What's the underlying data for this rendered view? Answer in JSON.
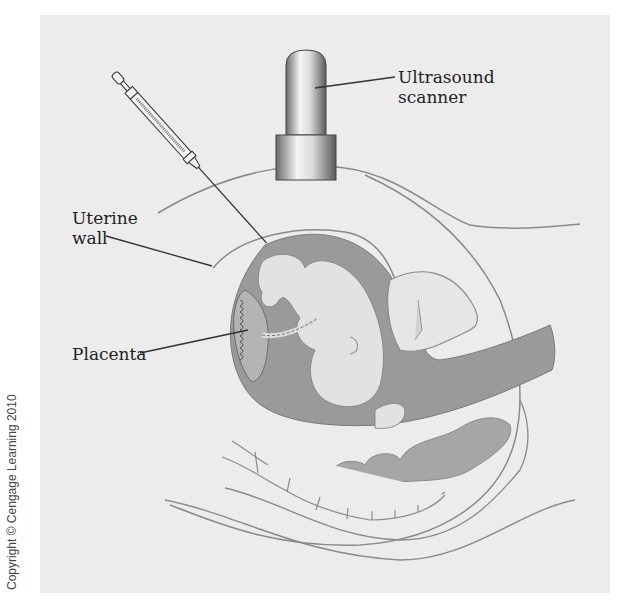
{
  "diagram": {
    "labels": {
      "ultrasound": [
        "Ultrasound",
        "scanner"
      ],
      "uterine_wall": [
        "Uterine",
        "wall"
      ],
      "placenta": "Placenta"
    },
    "components": [
      "syringe-with-needle",
      "ultrasound-scanner",
      "abdomen",
      "uterus",
      "amniotic-fluid",
      "fetus",
      "placenta",
      "umbilical-cord",
      "bladder",
      "intestine",
      "spine-vertebrae"
    ],
    "copyright": "Copyright © Cengage Learning 2010",
    "colors": {
      "background_panel": "#ececec",
      "amniotic_fluid": "#9a9a9a",
      "fetus": "#e2e2e2",
      "outline": "#8a8a8a",
      "leader_line": "#333333",
      "text": "#222222"
    }
  }
}
